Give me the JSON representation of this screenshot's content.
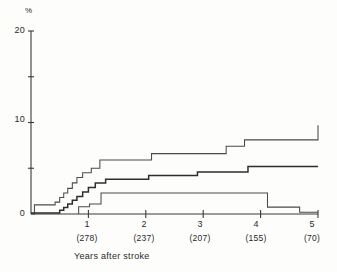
{
  "chart_data": {
    "type": "line",
    "title": "",
    "xlabel": "Years after stroke",
    "ylabel": "%",
    "xlim": [
      0,
      5
    ],
    "ylim": [
      0,
      20
    ],
    "grid": false,
    "legend": "none",
    "y_ticks": [
      0,
      5,
      10,
      15,
      20
    ],
    "y_tick_labels": [
      "0",
      "",
      "10",
      "",
      "20"
    ],
    "x_ticks": [
      1,
      2,
      3,
      4,
      5
    ],
    "x_tick_labels": [
      "1",
      "2",
      "3",
      "4",
      "5"
    ],
    "x_at_risk_labels": [
      "(278)",
      "(237)",
      "(207)",
      "(155)",
      "(70)"
    ],
    "series": [
      {
        "name": "upper-curve",
        "style": "step",
        "x": [
          0,
          0.06,
          0.3,
          0.42,
          0.5,
          0.57,
          0.64,
          0.72,
          0.8,
          0.9,
          1.05,
          1.2,
          1.95,
          2.1,
          2.95,
          3.4,
          3.72,
          4.7,
          5.0
        ],
        "y": [
          0.0,
          1.0,
          1.0,
          1.3,
          1.8,
          2.3,
          2.8,
          3.4,
          4.0,
          4.5,
          5.0,
          5.9,
          5.9,
          6.6,
          6.6,
          7.4,
          8.1,
          8.1,
          9.7
        ]
      },
      {
        "name": "middle-curve",
        "style": "step",
        "x": [
          0,
          0.42,
          0.5,
          0.57,
          0.64,
          0.72,
          0.8,
          0.9,
          1.0,
          1.12,
          1.3,
          1.9,
          2.05,
          2.75,
          2.9,
          3.65,
          3.78,
          5.0
        ],
        "y": [
          0.1,
          0.1,
          0.4,
          0.7,
          1.1,
          1.5,
          1.9,
          2.4,
          2.9,
          3.4,
          3.8,
          3.8,
          4.2,
          4.2,
          4.6,
          4.6,
          5.2,
          5.2
        ]
      },
      {
        "name": "lower-curve",
        "style": "step",
        "x": [
          0.83,
          0.83,
          1.02,
          1.02,
          1.22,
          1.22,
          4.12,
          4.12,
          4.68,
          4.68,
          5.0
        ],
        "y": [
          0.0,
          0.8,
          0.8,
          1.1,
          1.1,
          2.3,
          2.3,
          0.75,
          0.75,
          0.2,
          0.2
        ]
      }
    ],
    "colors": {
      "axis": "#3a3a3a",
      "upper_curve": "#4a4a4a",
      "middle_curve": "#2e2e2e",
      "lower_curve": "#4a4a4a"
    }
  }
}
